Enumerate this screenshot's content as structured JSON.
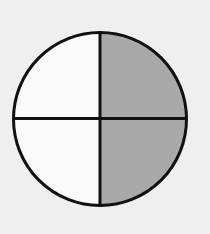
{
  "diagram": {
    "type": "fraction-circle",
    "total_parts": 4,
    "shaded_parts": 2,
    "shaded_quadrants": [
      "top-right",
      "bottom-right"
    ],
    "unshaded_quadrants": [
      "top-left",
      "bottom-left"
    ],
    "colors": {
      "background": "#efefef",
      "shaded": "#a9a9a9",
      "unshaded": "#fafafa",
      "stroke": "#111111"
    },
    "geometry": {
      "cx": 100,
      "cy": 119,
      "r": 86.5,
      "stroke_width": 3
    }
  }
}
